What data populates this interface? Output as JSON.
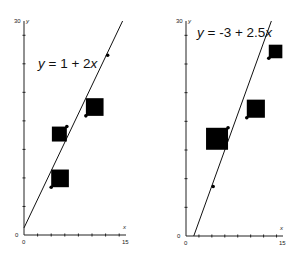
{
  "chart_data": [
    {
      "type": "scatter",
      "title": "",
      "annotation": "y = 1 + 2x",
      "eq_parts": [
        "y",
        " = 1 + 2",
        "x"
      ],
      "xlabel": "x",
      "ylabel": "y",
      "xlim": [
        0,
        15
      ],
      "ylim": [
        0,
        30
      ],
      "x_tick_labels": [
        "0",
        "15"
      ],
      "y_tick_labels": [
        "0",
        "30"
      ],
      "x_tick_step": 2,
      "y_tick_step": 4,
      "fit_line": {
        "intercept": 1,
        "slope": 2
      },
      "points": [
        {
          "x": 12.3,
          "y": 25.2,
          "influence": 0
        },
        {
          "x": 9.1,
          "y": 16.7,
          "influence": 2.6
        },
        {
          "x": 6.3,
          "y": 15.2,
          "influence": 2.2
        },
        {
          "x": 4.0,
          "y": 6.7,
          "influence": 2.6
        }
      ],
      "square_corner": [
        "bl",
        "bl",
        "tr",
        "bl"
      ]
    },
    {
      "type": "scatter",
      "title": "",
      "annotation": "y = -3 + 2.5x",
      "eq_parts": [
        "y",
        " = -3 + 2.5",
        "x"
      ],
      "xlabel": "x",
      "ylabel": "y",
      "xlim": [
        0,
        15
      ],
      "ylim": [
        0,
        30
      ],
      "x_tick_labels": [
        "0",
        "15"
      ],
      "y_tick_labels": [
        "0",
        "30"
      ],
      "x_tick_step": 2,
      "y_tick_step": 4,
      "fit_line": {
        "intercept": -3,
        "slope": 2.5
      },
      "points": [
        {
          "x": 12.8,
          "y": 24.8,
          "influence": 2.1
        },
        {
          "x": 9.4,
          "y": 16.5,
          "influence": 2.8
        },
        {
          "x": 6.5,
          "y": 15.1,
          "influence": 3.4
        },
        {
          "x": 4.2,
          "y": 6.9,
          "influence": 0
        }
      ],
      "square_corner": [
        "bl",
        "bl",
        "tr",
        "bl"
      ]
    }
  ]
}
